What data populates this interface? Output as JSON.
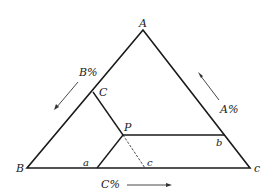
{
  "diagram": {
    "type": "ternary-phase-diagram",
    "vertices": {
      "top": "A",
      "bottom_left": "B",
      "bottom_right": "c"
    },
    "points": {
      "on_AB": "C",
      "interior": "P",
      "on_AC_side": "b",
      "on_base_left": "a",
      "on_base_dashed": "c"
    },
    "axis_labels": {
      "left": "B%",
      "right": "A%",
      "bottom": "C%"
    },
    "colors": {
      "line": "#1a1a1a",
      "text": "#222222",
      "background": "#ffffff"
    }
  }
}
